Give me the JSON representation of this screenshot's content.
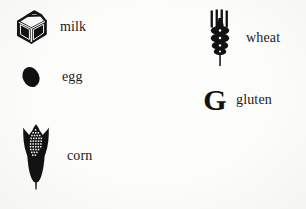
{
  "sheet": {
    "title": "Allergen Icon Legend",
    "background_color": "#fcfcfa",
    "ink_color": "#111111",
    "label_color": "#1a1a1a"
  },
  "legend": {
    "columns": [
      {
        "name": "left-column",
        "items": [
          {
            "id": "milk",
            "label": "milk",
            "icon": "milk-carton-icon"
          },
          {
            "id": "egg",
            "label": "egg",
            "icon": "egg-icon"
          },
          {
            "id": "corn",
            "label": "corn",
            "icon": "corn-cob-icon"
          }
        ]
      },
      {
        "name": "right-column",
        "items": [
          {
            "id": "wheat",
            "label": "wheat",
            "icon": "wheat-stalk-icon"
          },
          {
            "id": "gluten",
            "label": "gluten",
            "icon": "letter-g-icon",
            "glyph": "G"
          }
        ]
      }
    ]
  }
}
